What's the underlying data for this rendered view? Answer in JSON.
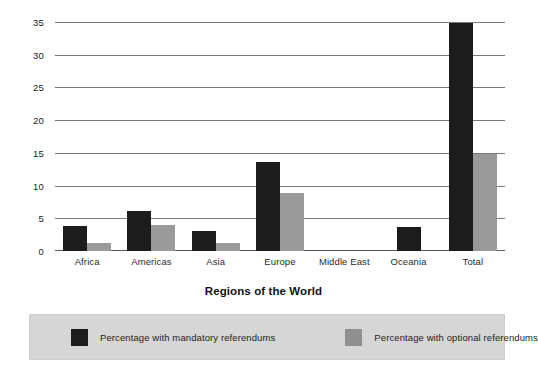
{
  "chart_data": {
    "type": "bar",
    "title": "",
    "xlabel": "Regions of the World",
    "ylabel": "",
    "ylim": [
      0,
      35
    ],
    "yticks": [
      0,
      5,
      10,
      15,
      20,
      25,
      30,
      35
    ],
    "grid": true,
    "legend_position": "bottom",
    "categories": [
      "Africa",
      "Americas",
      "Asia",
      "Europe",
      "Middle East",
      "Oceania",
      "Total"
    ],
    "series": [
      {
        "name": "Percentage with mandatory referendums",
        "color": "#1c1c1c",
        "values": [
          3.8,
          6.1,
          3.0,
          13.6,
          0,
          3.7,
          34.8
        ]
      },
      {
        "name": "Percentage with optional referendums",
        "color": "#9a9a9a",
        "values": [
          1.2,
          4.0,
          1.2,
          8.8,
          0,
          0,
          14.8
        ]
      }
    ]
  },
  "axis": {
    "x_title": "Regions of the World",
    "tick_labels_y": [
      "35",
      "30",
      "25",
      "20",
      "15",
      "10",
      "5",
      "0"
    ],
    "tick_labels_x": [
      "Africa",
      "Americas",
      "Asia",
      "Europe",
      "Middle East",
      "Oceania",
      "Total"
    ]
  },
  "legend": {
    "items": [
      {
        "label": "Percentage with mandatory referendums",
        "color": "#1c1c1c"
      },
      {
        "label": "Percentage with optional referendums",
        "color": "#8f8f8f"
      }
    ]
  }
}
